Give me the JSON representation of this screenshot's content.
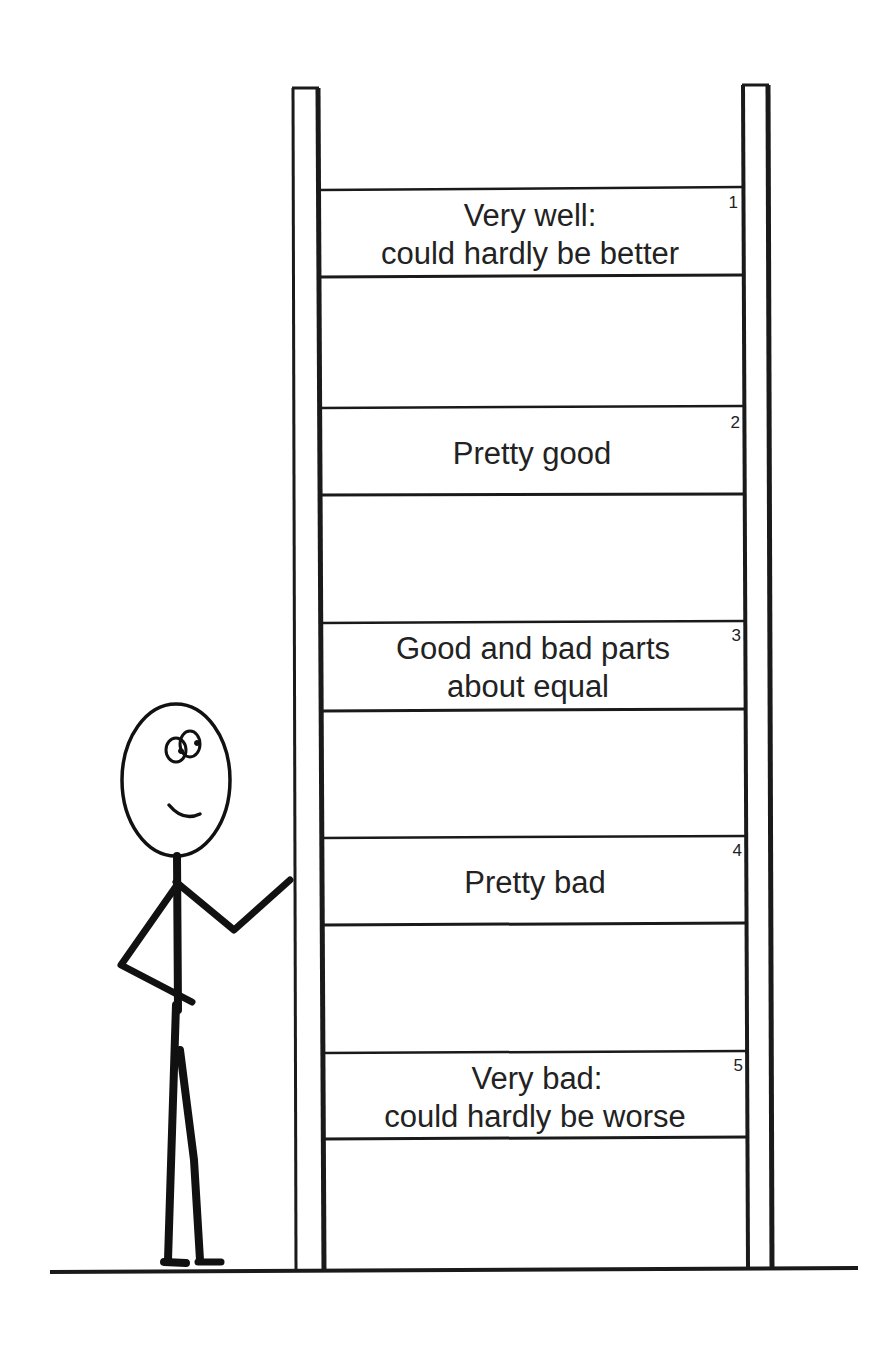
{
  "rungs": [
    {
      "number": "1",
      "lines": [
        "Very well:",
        "could hardly be better"
      ]
    },
    {
      "number": "2",
      "lines": [
        "Pretty good"
      ]
    },
    {
      "number": "3",
      "lines": [
        "Good and bad parts",
        "about equal"
      ]
    },
    {
      "number": "4",
      "lines": [
        "Pretty bad"
      ]
    },
    {
      "number": "5",
      "lines": [
        "Very bad:",
        "could hardly be worse"
      ]
    }
  ],
  "colors": {
    "ink": "#1a1a1a",
    "background": "#ffffff"
  }
}
